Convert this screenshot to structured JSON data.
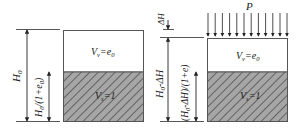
{
  "diagram": {
    "left": {
      "total_height_label": "H",
      "total_height_sub": "0",
      "solid_height_label": "H",
      "solid_height_sub": "0",
      "solid_height_suffix": "/(1+e",
      "solid_height_suffix_sub": "0",
      "solid_height_close": ")",
      "void_label": "V",
      "void_sub": "v",
      "void_eq": "=e",
      "void_eq_sub": "0",
      "solid_label": "V",
      "solid_sub": "s",
      "solid_eq": "=1"
    },
    "right": {
      "load_label": "P",
      "settlement_label": "ΔH",
      "total_height_label": "H",
      "total_height_sub": "0",
      "total_height_suffix": "-ΔH",
      "solid_height_label": "(H",
      "solid_height_sub": "0",
      "solid_height_suffix": "-ΔH)/(1+e)",
      "void_label": "V",
      "void_sub": "v",
      "void_eq": "=e",
      "void_eq_sub": "0",
      "solid_label": "V",
      "solid_sub": "s",
      "solid_eq": "=1"
    },
    "colors": {
      "line": "#333333",
      "solid_fill": "#a6a6a6",
      "hatch": "#4a4a4a",
      "void_fill": "#ffffff"
    }
  }
}
